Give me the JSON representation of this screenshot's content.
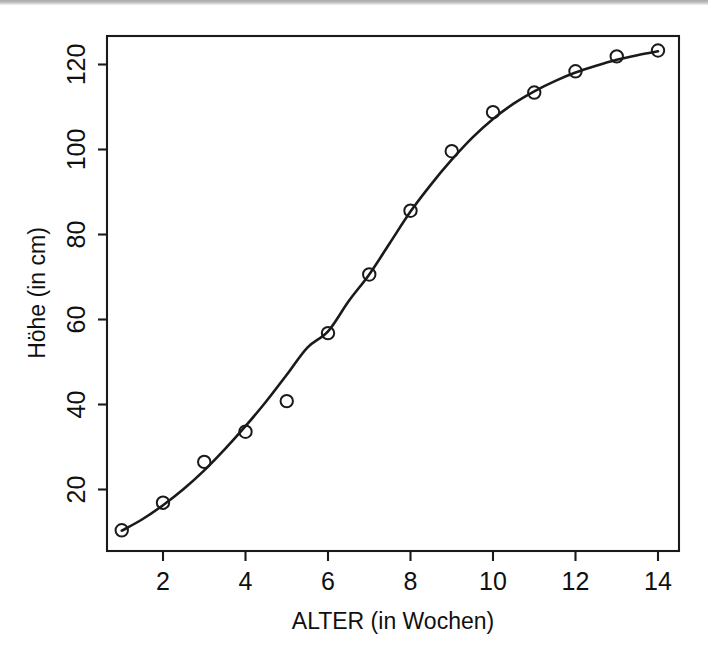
{
  "figure": {
    "background_color": "#ffffff",
    "ink_color": "#1a1a1a",
    "scan_edge_color": "#a9a9a9"
  },
  "chart_data": {
    "type": "scatter",
    "title": "",
    "subtitle": "",
    "xlabel": "ALTER (in Wochen)",
    "ylabel": "Höhe (in cm)",
    "xlim": [
      0.55,
      14.6
    ],
    "ylim": [
      5.0,
      127.5
    ],
    "xticks": [
      2,
      4,
      6,
      8,
      10,
      12,
      14
    ],
    "xtick_labels": [
      "2",
      "4",
      "6",
      "8",
      "10",
      "12",
      "14"
    ],
    "yticks": [
      20,
      40,
      60,
      80,
      100,
      120
    ],
    "ytick_labels": [
      "20",
      "40",
      "60",
      "80",
      "100",
      "120"
    ],
    "grid": false,
    "legend": false,
    "legend_position": "none",
    "marker": "open-circle",
    "x": [
      1,
      2,
      3,
      4,
      5,
      6,
      7,
      8,
      9,
      10,
      11,
      12,
      13,
      14
    ],
    "values": [
      10.4,
      16.9,
      26.5,
      33.6,
      40.8,
      56.8,
      70.6,
      85.6,
      99.6,
      108.8,
      113.4,
      118.4,
      121.9,
      123.3
    ],
    "series": [
      {
        "name": "Messwerte",
        "style": "points",
        "x": [
          1,
          2,
          3,
          4,
          5,
          6,
          7,
          8,
          9,
          10,
          11,
          12,
          13,
          14
        ],
        "values": [
          10.4,
          16.9,
          26.5,
          33.6,
          40.8,
          56.8,
          70.6,
          85.6,
          99.6,
          108.8,
          113.4,
          118.4,
          121.9,
          123.3
        ]
      },
      {
        "name": "Angepasste Kurve",
        "style": "line",
        "x": [
          1,
          1.5,
          2,
          2.5,
          3,
          3.5,
          4,
          4.5,
          5,
          5.5,
          6,
          6.5,
          7,
          7.5,
          8,
          8.5,
          9,
          9.5,
          10,
          10.5,
          11,
          11.5,
          12,
          12.5,
          13,
          13.5,
          14
        ],
        "values": [
          10.3,
          13.0,
          16.3,
          20.1,
          24.5,
          29.5,
          34.9,
          40.7,
          47.0,
          53.4,
          57.2,
          64.3,
          70.6,
          78.0,
          85.4,
          91.8,
          97.6,
          102.8,
          107.2,
          110.8,
          113.7,
          116.1,
          118.1,
          119.7,
          121.1,
          122.2,
          123.1
        ]
      }
    ]
  },
  "axes": {
    "x_axis_name": "ALTER (in Wochen)",
    "y_axis_name": "Höhe (in cm)",
    "y_label_rotation": "vertical"
  }
}
